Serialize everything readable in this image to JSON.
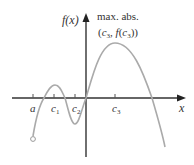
{
  "diagram": {
    "y_axis_label": "f(x)",
    "x_axis_label": "x",
    "annotation": {
      "line1": "max. abs.",
      "line2": "(c3, f(c3))"
    },
    "ticks": [
      {
        "label": "a",
        "x": 33
      },
      {
        "label": "c1",
        "x": 54
      },
      {
        "label": "c2",
        "x": 75
      },
      {
        "label": "c3",
        "x": 115
      }
    ],
    "colors": {
      "axis": "#333333",
      "curve": "#aaaaaa",
      "text": "#333333"
    },
    "curve_points": {
      "start_open_point": {
        "x": 33,
        "y": 139
      },
      "local_max_c1": {
        "x": 55,
        "y": 85
      },
      "local_min_c2": {
        "x": 75,
        "y": 124
      },
      "absolute_max_c3": {
        "x": 115,
        "y": 43
      },
      "end": {
        "x": 165,
        "y": 147
      }
    }
  }
}
